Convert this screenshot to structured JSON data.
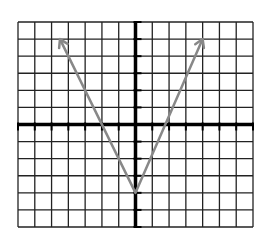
{
  "graph": {
    "type": "coordinate-plane",
    "x_range": [
      -7,
      7
    ],
    "y_range": [
      -6,
      6
    ],
    "grid": true,
    "axis_color": "#000000",
    "grid_color": "#222222",
    "curve_color": "#888888",
    "function": "y = 2|x| - 4",
    "vertex": [
      0,
      -4
    ],
    "arrow_endpoints": [
      [
        -4.5,
        5
      ],
      [
        4,
        5
      ]
    ]
  }
}
